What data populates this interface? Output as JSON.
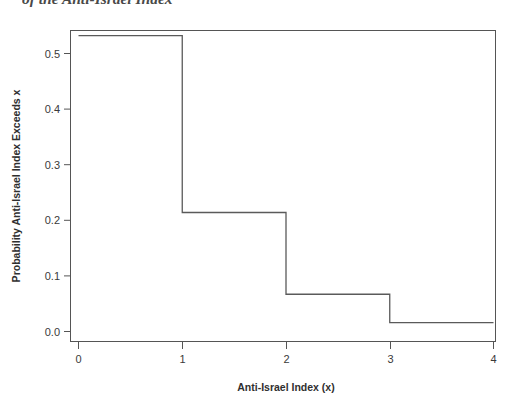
{
  "caption": {
    "clipped_text": "of the Anti-Israel Index"
  },
  "chart_data": {
    "type": "line",
    "subtype": "step-survival-function",
    "title": "",
    "xlabel": "Anti-Israel Index (x)",
    "ylabel": "Probability Anti-Israel Index Exceeds x",
    "xlim": [
      0,
      4
    ],
    "ylim": [
      0.0,
      0.55
    ],
    "grid": false,
    "legend": "none",
    "xticks": [
      0,
      1,
      2,
      3,
      4
    ],
    "xticklabels": [
      "0",
      "1",
      "2",
      "3",
      "4"
    ],
    "yticks": [
      0.0,
      0.1,
      0.2,
      0.3,
      0.4,
      0.5
    ],
    "yticklabels": [
      "0.0",
      "0.1",
      "0.2",
      "0.3",
      "0.4",
      "0.5"
    ],
    "x": [
      0,
      1,
      2,
      3,
      4
    ],
    "values": [
      0.532,
      0.214,
      0.067,
      0.016,
      0.016
    ],
    "steps": [
      {
        "x_start": 0,
        "x_end": 1,
        "y": 0.532
      },
      {
        "x_start": 1,
        "x_end": 2,
        "y": 0.214
      },
      {
        "x_start": 2,
        "x_end": 3,
        "y": 0.067
      },
      {
        "x_start": 3,
        "x_end": 4,
        "y": 0.016
      }
    ],
    "line_color": "#5a5a5a",
    "frame_color": "#555555",
    "background": "#ffffff"
  },
  "axes": {
    "x_title": "Anti-Israel Index (x)",
    "y_title": "Probability Anti-Israel Index Exceeds x"
  }
}
